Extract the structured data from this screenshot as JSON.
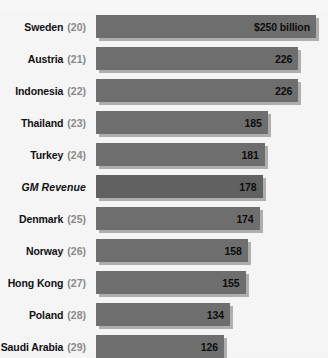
{
  "chart_data": {
    "type": "bar",
    "title": "",
    "subtitle": "",
    "xlabel": "",
    "ylabel": "",
    "orientation": "horizontal",
    "grid": false,
    "legend": false,
    "unit": "$ billion",
    "xlim": [
      0,
      250
    ],
    "categories": [
      "Sweden",
      "Austria",
      "Indonesia",
      "Thailand",
      "Turkey",
      "GM Revenue",
      "Denmark",
      "Norway",
      "Hong Kong",
      "Poland",
      "Saudi Arabia"
    ],
    "values": [
      250,
      226,
      226,
      185,
      181,
      178,
      174,
      158,
      155,
      134,
      126
    ],
    "value_labels": [
      "$250 billion",
      "226",
      "226",
      "185",
      "181",
      "178",
      "174",
      "158",
      "155",
      "134",
      "126"
    ],
    "ranks": [
      "(20)",
      "(21)",
      "(22)",
      "(23)",
      "(24)",
      "",
      "(25)",
      "(26)",
      "(27)",
      "(28)",
      "(29)"
    ],
    "rows": [
      {
        "name": "Sweden",
        "rank": "(20)",
        "value": 250,
        "value_label": "$250 billion",
        "italic": false,
        "highlight": false
      },
      {
        "name": "Austria",
        "rank": "(21)",
        "value": 226,
        "value_label": "226",
        "italic": false,
        "highlight": false
      },
      {
        "name": "Indonesia",
        "rank": "(22)",
        "value": 226,
        "value_label": "226",
        "italic": false,
        "highlight": false
      },
      {
        "name": "Thailand",
        "rank": "(23)",
        "value": 185,
        "value_label": "185",
        "italic": false,
        "highlight": false
      },
      {
        "name": "Turkey",
        "rank": "(24)",
        "value": 181,
        "value_label": "181",
        "italic": false,
        "highlight": false
      },
      {
        "name": "GM Revenue",
        "rank": "",
        "value": 178,
        "value_label": "178",
        "italic": true,
        "highlight": true
      },
      {
        "name": "Denmark",
        "rank": "(25)",
        "value": 174,
        "value_label": "174",
        "italic": false,
        "highlight": false
      },
      {
        "name": "Norway",
        "rank": "(26)",
        "value": 158,
        "value_label": "158",
        "italic": false,
        "highlight": false
      },
      {
        "name": "Hong Kong",
        "rank": "(27)",
        "value": 155,
        "value_label": "155",
        "italic": false,
        "highlight": false
      },
      {
        "name": "Poland",
        "rank": "(28)",
        "value": 134,
        "value_label": "134",
        "italic": false,
        "highlight": false
      },
      {
        "name": "Saudi Arabia",
        "rank": "(29)",
        "value": 126,
        "value_label": "126",
        "italic": false,
        "highlight": false
      }
    ]
  },
  "style": {
    "bar_color": "#6e6e6e",
    "bar_highlight_color": "#616161",
    "shadow_color": "#969696",
    "background": "#f5f5f5",
    "label_color": "#111111",
    "rank_color": "#8a8a8a",
    "value_color": "#0d0d0d"
  },
  "layout": {
    "bar_left_px": 96,
    "bar_height_px": 23,
    "row_pitch_px": 32,
    "first_row_top_px": 15,
    "min_bar_px": 128,
    "max_bar_px": 220,
    "min_value": 126,
    "max_value": 250
  }
}
